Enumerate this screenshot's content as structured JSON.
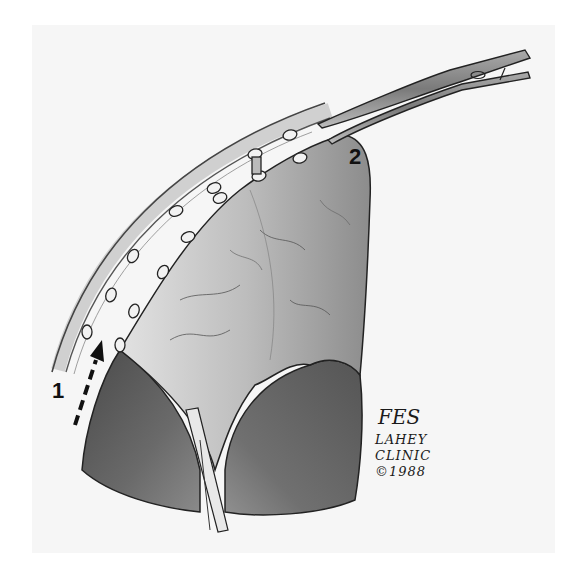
{
  "figure": {
    "labels": {
      "step_1": "1",
      "step_2": "2"
    },
    "signature": {
      "initials": "FES",
      "line1": "LAHEY",
      "line2": "CLINIC",
      "line3": "©1988"
    },
    "colors": {
      "background": "#ffffff",
      "panel": "#f6f6f6",
      "ink": "#1a1a1a",
      "dark_tissue": "#5a5a5a",
      "flap": "#c8c8c8"
    }
  }
}
